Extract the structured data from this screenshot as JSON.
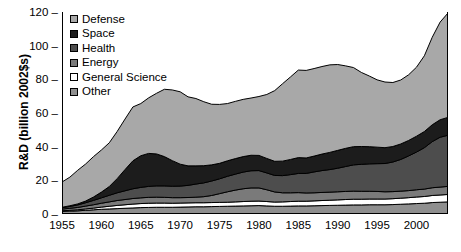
{
  "title_sliver": "",
  "axes": {
    "ylabel": "R&D (billion 2002$s)",
    "xlabel": "",
    "yticks": [
      "0",
      "20",
      "40",
      "60",
      "80",
      "100",
      "120"
    ],
    "xticks": [
      "1955",
      "1960",
      "1965",
      "1970",
      "1975",
      "1980",
      "1985",
      "1990",
      "1995",
      "2000"
    ]
  },
  "colors": {
    "defense": "#a8a8a8",
    "space": "#1c1c1c",
    "health": "#4d4d4d",
    "energy": "#7a7a7a",
    "general_science": "#ffffff",
    "other": "#8f8f8f",
    "outline": "#000000",
    "background": "#ffffff"
  },
  "legend": {
    "position": "top-left-inside",
    "items": [
      {
        "label": "Defense",
        "swatch": "#a8a8a8"
      },
      {
        "label": "Space",
        "swatch": "#1c1c1c"
      },
      {
        "label": "Health",
        "swatch": "#4d4d4d"
      },
      {
        "label": "Energy",
        "swatch": "#7a7a7a"
      },
      {
        "label": "General Science",
        "swatch": "#ffffff"
      },
      {
        "label": "Other",
        "swatch": "#8f8f8f"
      }
    ]
  },
  "chart_data": {
    "type": "area",
    "stacked": true,
    "title": "",
    "xlabel": "",
    "ylabel": "R&D (billion 2002$s)",
    "xlim": [
      1955,
      2004
    ],
    "ylim": [
      0,
      120
    ],
    "ytick_step": 20,
    "xtick_step": 5,
    "grid": false,
    "legend_entries": [
      "Defense",
      "Space",
      "Health",
      "Energy",
      "General Science",
      "Other"
    ],
    "stack_order_bottom_to_top": [
      "Other",
      "General Science",
      "Energy",
      "Health",
      "Space",
      "Defense"
    ],
    "x": [
      1955,
      1956,
      1957,
      1958,
      1959,
      1960,
      1961,
      1962,
      1963,
      1964,
      1965,
      1966,
      1967,
      1968,
      1969,
      1970,
      1971,
      1972,
      1973,
      1974,
      1975,
      1976,
      1977,
      1978,
      1979,
      1980,
      1981,
      1982,
      1983,
      1984,
      1985,
      1986,
      1987,
      1988,
      1989,
      1990,
      1991,
      1992,
      1993,
      1994,
      1995,
      1996,
      1997,
      1998,
      1999,
      2000,
      2001,
      2002,
      2003,
      2004
    ],
    "series": [
      {
        "name": "Other",
        "values": [
          1.5,
          1.7,
          1.9,
          2.2,
          2.5,
          2.8,
          3.0,
          3.2,
          3.4,
          3.6,
          3.8,
          3.9,
          4.0,
          4.0,
          4.0,
          4.1,
          4.2,
          4.3,
          4.3,
          4.4,
          4.5,
          4.6,
          4.7,
          4.8,
          4.9,
          5.0,
          4.8,
          4.6,
          4.6,
          4.7,
          4.8,
          4.8,
          4.9,
          5.0,
          5.1,
          5.2,
          5.3,
          5.4,
          5.4,
          5.5,
          5.5,
          5.5,
          5.6,
          5.8,
          6.0,
          6.2,
          6.4,
          6.8,
          7.0,
          7.2
        ]
      },
      {
        "name": "General Science",
        "values": [
          0.4,
          0.5,
          0.6,
          0.8,
          1.0,
          1.3,
          1.6,
          1.9,
          2.1,
          2.3,
          2.4,
          2.5,
          2.5,
          2.5,
          2.4,
          2.4,
          2.4,
          2.4,
          2.4,
          2.4,
          2.4,
          2.4,
          2.5,
          2.6,
          2.7,
          2.7,
          2.6,
          2.5,
          2.6,
          2.7,
          2.8,
          2.8,
          2.9,
          3.0,
          3.1,
          3.2,
          3.3,
          3.4,
          3.4,
          3.4,
          3.4,
          3.4,
          3.5,
          3.6,
          3.7,
          3.9,
          4.0,
          4.2,
          4.3,
          4.4
        ]
      },
      {
        "name": "Energy",
        "values": [
          1.0,
          1.2,
          1.4,
          1.7,
          2.0,
          2.3,
          2.6,
          2.9,
          3.1,
          3.3,
          3.4,
          3.5,
          3.5,
          3.4,
          3.3,
          3.2,
          3.2,
          3.3,
          3.6,
          4.2,
          5.2,
          6.2,
          7.0,
          7.6,
          7.9,
          7.8,
          7.0,
          6.0,
          5.4,
          5.2,
          5.1,
          4.9,
          4.8,
          4.8,
          4.8,
          4.8,
          4.8,
          4.8,
          4.7,
          4.6,
          4.5,
          4.3,
          4.2,
          4.2,
          4.2,
          4.3,
          4.4,
          4.6,
          4.7,
          4.8
        ]
      },
      {
        "name": "Health",
        "values": [
          0.8,
          1.1,
          1.5,
          2.0,
          2.6,
          3.2,
          3.9,
          4.6,
          5.2,
          5.8,
          6.2,
          6.5,
          6.7,
          6.8,
          6.8,
          6.9,
          7.2,
          7.8,
          8.2,
          8.6,
          8.8,
          9.2,
          9.5,
          9.9,
          10.2,
          10.3,
          10.0,
          9.8,
          10.2,
          10.8,
          11.4,
          11.6,
          12.4,
          13.0,
          13.4,
          14.0,
          14.8,
          15.6,
          16.0,
          16.3,
          16.5,
          16.8,
          17.6,
          18.8,
          20.6,
          22.4,
          24.6,
          27.4,
          29.6,
          30.4
        ]
      },
      {
        "name": "Space",
        "values": [
          0.3,
          0.4,
          0.6,
          1.0,
          2.0,
          3.4,
          5.2,
          8.4,
          12.6,
          16.6,
          18.8,
          19.6,
          19.0,
          17.4,
          15.2,
          13.0,
          11.6,
          10.8,
          10.2,
          9.6,
          9.2,
          9.2,
          9.2,
          9.2,
          9.2,
          9.0,
          8.6,
          8.4,
          8.6,
          9.0,
          9.4,
          9.2,
          9.4,
          9.8,
          10.2,
          10.6,
          10.8,
          10.8,
          10.6,
          10.2,
          9.8,
          9.4,
          9.2,
          9.2,
          9.2,
          9.4,
          9.6,
          10.0,
          10.4,
          10.6
        ]
      },
      {
        "name": "Defense",
        "values": [
          15.0,
          17.0,
          20.0,
          22.0,
          24.0,
          25.0,
          26.0,
          28.0,
          30.0,
          32.0,
          31.0,
          33.0,
          36.0,
          40.0,
          42.0,
          43.0,
          41.0,
          40.0,
          38.0,
          36.0,
          35.0,
          34.0,
          34.0,
          34.0,
          34.0,
          35.0,
          38.0,
          42.0,
          46.0,
          49.0,
          52.0,
          52.0,
          52.0,
          52.0,
          52.0,
          51.0,
          49.0,
          47.0,
          44.0,
          42.0,
          40.0,
          39.0,
          38.0,
          38.0,
          39.0,
          41.0,
          45.0,
          52.0,
          58.0,
          62.0
        ]
      }
    ],
    "totals_note": "Stacked total rises from ~19 in 1955 to a 1966-67 peak near 74, dips to ~57 in 1975, plateaus near 86 in 1988-1991, dips to ~78 in 1997, then climbs to ~118 by 2004."
  }
}
